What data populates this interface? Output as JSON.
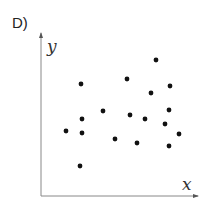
{
  "panel": {
    "label": "D)"
  },
  "chart_data": {
    "type": "scatter",
    "title": "",
    "xlabel": "x",
    "ylabel": "y",
    "grid": false,
    "legend": null,
    "ticks": false,
    "xlim": [
      0,
      157
    ],
    "ylim": [
      0,
      163
    ],
    "point_color": "#111111",
    "axis_color": "#888888",
    "points": [
      {
        "x": 40,
        "y": 112
      },
      {
        "x": 86,
        "y": 117
      },
      {
        "x": 115,
        "y": 136
      },
      {
        "x": 129,
        "y": 110
      },
      {
        "x": 110,
        "y": 103
      },
      {
        "x": 62,
        "y": 85
      },
      {
        "x": 41,
        "y": 77
      },
      {
        "x": 89,
        "y": 81
      },
      {
        "x": 104,
        "y": 77
      },
      {
        "x": 128,
        "y": 86
      },
      {
        "x": 25,
        "y": 65
      },
      {
        "x": 41,
        "y": 63
      },
      {
        "x": 74,
        "y": 57
      },
      {
        "x": 124,
        "y": 72
      },
      {
        "x": 138,
        "y": 62
      },
      {
        "x": 96,
        "y": 53
      },
      {
        "x": 128,
        "y": 50
      },
      {
        "x": 39,
        "y": 30
      }
    ]
  }
}
